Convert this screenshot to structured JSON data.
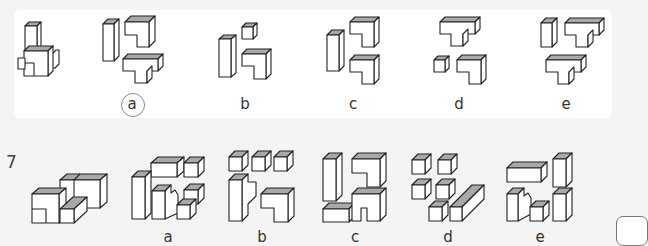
{
  "problem_6": {
    "options": [
      {
        "key": "a",
        "label": "a",
        "selected": true
      },
      {
        "key": "b",
        "label": "b",
        "selected": false
      },
      {
        "key": "c",
        "label": "c",
        "selected": false
      },
      {
        "key": "d",
        "label": "d",
        "selected": false
      },
      {
        "key": "e",
        "label": "e",
        "selected": false
      }
    ]
  },
  "problem_7": {
    "number": "7",
    "options": [
      {
        "key": "a",
        "label": "a"
      },
      {
        "key": "b",
        "label": "b"
      },
      {
        "key": "c",
        "label": "c"
      },
      {
        "key": "d",
        "label": "d"
      },
      {
        "key": "e",
        "label": "e"
      }
    ]
  },
  "colors": {
    "top_face": "#a9a9a9",
    "panel_bg": "#ffffff",
    "page_bg": "#f4f4f4",
    "stroke": "#222222"
  }
}
